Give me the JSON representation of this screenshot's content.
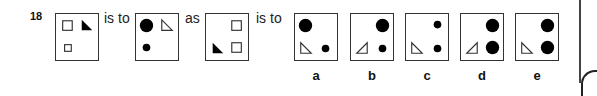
{
  "question": {
    "number": "18",
    "connector_1": "is to",
    "connector_2": "as",
    "connector_3": "is to"
  },
  "figures": {
    "premise_1": {
      "description": "top-left open square, top-right filled triangle, bottom-left small open square"
    },
    "premise_2": {
      "description": "top-left large filled circle, top-right open triangle, bottom-left small filled circle"
    },
    "premise_3": {
      "description": "top-right open square, bottom-left filled triangle, bottom-right open square"
    }
  },
  "options": [
    {
      "label": "a",
      "description": "top-left large filled circle, bottom-left open triangle, bottom-right small filled circle"
    },
    {
      "label": "b",
      "description": "top-right large filled circle, bottom-left open triangle (mirrored), bottom-right small filled circle"
    },
    {
      "label": "c",
      "description": "top-right small filled circle, bottom-left open triangle, bottom-right small filled circle"
    },
    {
      "label": "d",
      "description": "top-right large filled circle, bottom-left open triangle (mirrored), bottom-right large filled circle"
    },
    {
      "label": "e",
      "description": "top-right large filled circle, bottom-left open triangle, bottom-right large filled circle"
    }
  ],
  "colors": {
    "stroke": "#333333",
    "fill": "#000000",
    "background": "#ffffff"
  }
}
